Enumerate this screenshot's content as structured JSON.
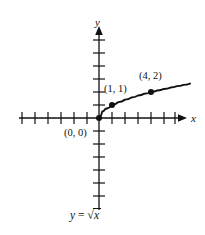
{
  "figure": {
    "background_color": "#ffffff",
    "ink_color": "#111111",
    "axis_labels": {
      "x": "x",
      "y": "y"
    },
    "equation_label": {
      "lhs": "y",
      "operator": "=",
      "radical_symbol": "√",
      "radicand": "x",
      "full_text": "y = √x"
    },
    "point_labels": [
      {
        "text": "(0, 0)",
        "name": "origin-point-label"
      },
      {
        "text": "(1, 1)",
        "name": "point-1-1-label"
      },
      {
        "text": "(4, 2)",
        "name": "point-4-2-label"
      }
    ]
  },
  "chart_data": {
    "type": "line",
    "title": "",
    "subtitle": "",
    "xlabel": "x",
    "ylabel": "y",
    "annotations": [
      {
        "text": "y = √x",
        "role": "function-equation"
      },
      {
        "text": "(0, 0)",
        "x": 0,
        "y": 0
      },
      {
        "text": "(1, 1)",
        "x": 1,
        "y": 1
      },
      {
        "text": "(4, 2)",
        "x": 4,
        "y": 2
      }
    ],
    "function": "y = sqrt(x)",
    "domain": [
      0,
      7
    ],
    "grid": false,
    "legend": null,
    "axis_style": "cartesian-arrows-with-unit-ticks",
    "xlim": [
      -6.5,
      6.5
    ],
    "ylim": [
      -7.5,
      7.5
    ],
    "x_tick_count_negative": 6,
    "x_tick_count_positive": 6,
    "y_tick_count_positive": 6,
    "y_tick_count_negative": 7,
    "series": [
      {
        "name": "y = sqrt(x)",
        "x": [
          0,
          0.25,
          0.5,
          1,
          1.5,
          2,
          2.5,
          3,
          3.5,
          4,
          4.5,
          5,
          5.5,
          6,
          6.5,
          7
        ],
        "y": [
          0,
          0.5,
          0.707,
          1,
          1.225,
          1.414,
          1.581,
          1.732,
          1.871,
          2,
          2.121,
          2.236,
          2.345,
          2.449,
          2.55,
          2.646
        ]
      }
    ],
    "markers": [
      {
        "label": "(0, 0)",
        "x": 0,
        "y": 0
      },
      {
        "label": "(1, 1)",
        "x": 1,
        "y": 1
      },
      {
        "label": "(4, 2)",
        "x": 4,
        "y": 2
      }
    ]
  }
}
